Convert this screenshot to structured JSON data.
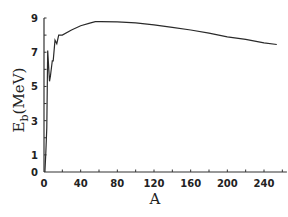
{
  "chart_data": {
    "type": "line",
    "title": "",
    "xlabel": "A",
    "ylabel": "E_b(MeV)",
    "ylabel_main": "E",
    "ylabel_sub": "b",
    "ylabel_unit": "(MeV)",
    "xlim": [
      0,
      260
    ],
    "ylim": [
      0,
      9
    ],
    "grid": false,
    "legend": null,
    "x_ticks": [
      0,
      40,
      80,
      120,
      160,
      200,
      240
    ],
    "x_tick_labels": [
      "0",
      "40",
      "80",
      "120",
      "160",
      "200",
      "240"
    ],
    "y_ticks": [
      0,
      1,
      3,
      5,
      7,
      9
    ],
    "y_tick_labels": [
      "0",
      "1",
      "3",
      "5",
      "7",
      "9"
    ],
    "series": [
      {
        "name": "Binding energy per nucleon",
        "x": [
          1,
          2,
          3,
          4,
          6,
          7,
          9,
          10,
          12,
          14,
          16,
          20,
          30,
          40,
          50,
          56,
          62,
          80,
          100,
          120,
          140,
          160,
          180,
          200,
          220,
          240,
          254
        ],
        "values": [
          0,
          1.1,
          2.6,
          7.1,
          5.3,
          5.6,
          6.5,
          6.5,
          7.7,
          7.5,
          8.0,
          8.0,
          8.3,
          8.55,
          8.7,
          8.79,
          8.79,
          8.78,
          8.72,
          8.6,
          8.45,
          8.3,
          8.12,
          7.9,
          7.75,
          7.55,
          7.45
        ]
      }
    ]
  },
  "colors": {
    "line": "#2a2a2a",
    "axis": "#333333",
    "background": "#ffffff"
  }
}
